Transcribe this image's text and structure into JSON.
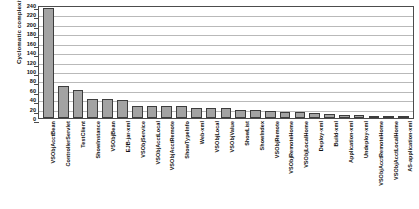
{
  "chart_data": {
    "type": "bar",
    "title": "",
    "xlabel": "",
    "ylabel": "Cyclomatic complexity",
    "ylim": [
      0,
      240
    ],
    "ytick_step": 20,
    "yticks": [
      240,
      220,
      200,
      180,
      160,
      140,
      120,
      100,
      80,
      60,
      40,
      20,
      0
    ],
    "grid": true,
    "legend": "none",
    "bar_color": "#a3a3a3",
    "bar_edge_color": "#3d3d3d",
    "categories": [
      "VSObjAcctBean",
      "ControllerServlet",
      "TestClient",
      "ShowInstance",
      "VSObjBean",
      "EJB-jar-xml",
      "VSObjService",
      "VSObjAcctLocal",
      "VSObjAcctRemote",
      "ShowTypeInfo",
      "Web-xml",
      "VSObjLocal",
      "VSObjValue",
      "ShowList",
      "ShowIndex",
      "VSObjRemote",
      "VSObjRemoteHome",
      "VSObjLocalHome",
      "Deploy-xml",
      "Build-xml",
      "Application-xml",
      "Undeploy-xml",
      "VSObjAcctRemoteHome",
      "VSObjAcctLocalHome",
      "AS-application-xml"
    ],
    "values": [
      237,
      70,
      61,
      42,
      42,
      40,
      26,
      26,
      26,
      26,
      22,
      22,
      22,
      18,
      18,
      16,
      12,
      12,
      10,
      8,
      6,
      6,
      5,
      4,
      3
    ]
  }
}
